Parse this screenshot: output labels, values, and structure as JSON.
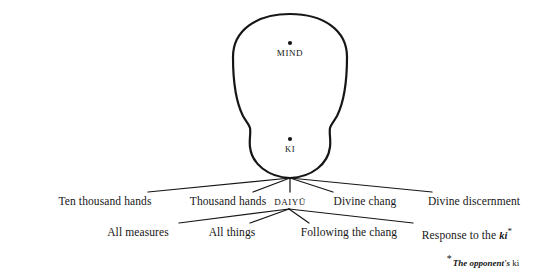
{
  "figure": {
    "background_color": "#ffffff",
    "stroke_color": "#161616",
    "canvas": {
      "width": 553,
      "height": 274
    }
  },
  "body_shape": {
    "name": "gourd",
    "upper_lobe": {
      "label": "MIND",
      "center_x": 290,
      "center_y": 72,
      "radius_x": 57,
      "radius_y": 58
    },
    "lower_lobe": {
      "label": "KI",
      "center_x": 290,
      "center_y": 147,
      "radius_x": 40,
      "radius_y": 32
    },
    "waist_y": 126,
    "apex_x": 290,
    "apex_y": 178
  },
  "nodes": [
    {
      "id": "mind",
      "label": "MIND",
      "dot_x": 290,
      "dot_y": 43,
      "label_x": 290,
      "label_y": 48
    },
    {
      "id": "ki",
      "label": "KI",
      "dot_x": 290,
      "dot_y": 139,
      "label_x": 290,
      "label_y": 144
    }
  ],
  "row_one": {
    "origin_x": 290,
    "origin_y": 178,
    "label_y": 195,
    "items": [
      {
        "label": "Ten thousand hands",
        "x": 105,
        "line_end_x": 148,
        "line_end_y": 192,
        "smallcaps": false
      },
      {
        "label": "Thousand hands",
        "x": 228,
        "line_end_x": 253,
        "line_end_y": 192,
        "smallcaps": false
      },
      {
        "label": "DAIYŪ",
        "x": 290,
        "line_end_x": 290,
        "line_end_y": 192,
        "smallcaps": true
      },
      {
        "label": "Divine chang",
        "x": 365,
        "line_end_x": 333,
        "line_end_y": 192,
        "smallcaps": false
      },
      {
        "label": "Divine discernment",
        "x": 474,
        "line_end_x": 432,
        "line_end_y": 192,
        "smallcaps": false
      }
    ]
  },
  "row_two": {
    "origin_x": 289,
    "origin_y": 209,
    "label_y": 226,
    "items": [
      {
        "label": "All measures",
        "x": 138,
        "line_end_x": 179,
        "line_end_y": 223,
        "italic_tail": "",
        "star": false
      },
      {
        "label": "All things",
        "x": 232,
        "line_end_x": 250,
        "line_end_y": 223,
        "italic_tail": "",
        "star": false
      },
      {
        "label": "Following the chang",
        "x": 349,
        "line_end_x": 309,
        "line_end_y": 223,
        "italic_tail": "",
        "star": false
      },
      {
        "label": "Response to the ",
        "x": 467,
        "line_end_x": 413,
        "line_end_y": 223,
        "italic_tail": "ki",
        "star": true
      }
    ]
  },
  "footnote": {
    "star": "*",
    "italic_text": "The opponent's",
    "roman_text": "ki",
    "x": 483,
    "y": 253
  }
}
